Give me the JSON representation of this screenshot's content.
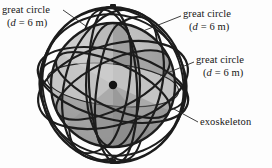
{
  "figure": {
    "caption_labels": [
      {
        "id": "great-circle-top-left",
        "line1": "great circle",
        "line2_prefix": "(",
        "line2_symbol": "d",
        "line2_suffix": " = 6 m)",
        "full_text": "great circle (d = 6 m)"
      },
      {
        "id": "great-circle-top-right",
        "line1": "great circle",
        "line2_prefix": "(",
        "line2_symbol": "d",
        "line2_suffix": " = 6 m)",
        "full_text": "great circle (d = 6 m)"
      },
      {
        "id": "great-circle-right",
        "line1": "great circle",
        "line2_prefix": "(",
        "line2_symbol": "d",
        "line2_suffix": " = 6 m)",
        "full_text": "great circle (d = 6 m)"
      },
      {
        "id": "exoskeleton",
        "line1": "exoskeleton",
        "full_text": "exoskeleton"
      }
    ],
    "geometry": {
      "diameter_label": "d = 6 m",
      "diameter_value": 6,
      "diameter_units": "m",
      "great_circle_count": 3,
      "center_marker": "center-point"
    },
    "colors": {
      "background": "#fdfdfd",
      "outline": "#1c1c1c",
      "sphere_light": "#c9c9c9",
      "sphere_mid": "#b0b0b0",
      "sphere_dark": "#8f8f8f",
      "sphere_darkest": "#7a7a7a",
      "disc_light": "#c4c4c4",
      "text": "#161616"
    }
  }
}
